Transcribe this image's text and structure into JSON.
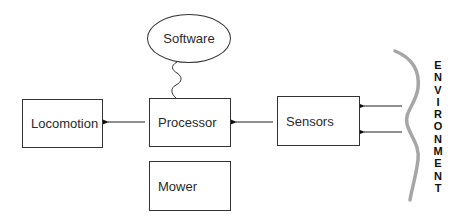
{
  "diagram": {
    "nodes": {
      "software": {
        "label": "Software",
        "shape": "ellipse"
      },
      "locomotion": {
        "label": "Locomotion",
        "shape": "rectangle"
      },
      "processor": {
        "label": "Processor",
        "shape": "rectangle"
      },
      "sensors": {
        "label": "Sensors",
        "shape": "rectangle"
      },
      "mower": {
        "label": "Mower",
        "shape": "rectangle"
      }
    },
    "environment": {
      "label": "ENVIRONMENT",
      "letters": [
        "E",
        "N",
        "V",
        "I",
        "R",
        "O",
        "N",
        "M",
        "E",
        "N",
        "T"
      ],
      "boundary_color": "#a6a6a6"
    },
    "edges": [
      {
        "from": "software",
        "to": "processor",
        "style": "wavy"
      },
      {
        "from": "processor",
        "to": "locomotion",
        "style": "arrow"
      },
      {
        "from": "sensors",
        "to": "processor",
        "style": "arrow"
      },
      {
        "from": "environment",
        "to": "sensors",
        "style": "arrow"
      },
      {
        "from": "environment",
        "to": "sensors",
        "style": "arrow"
      }
    ]
  }
}
